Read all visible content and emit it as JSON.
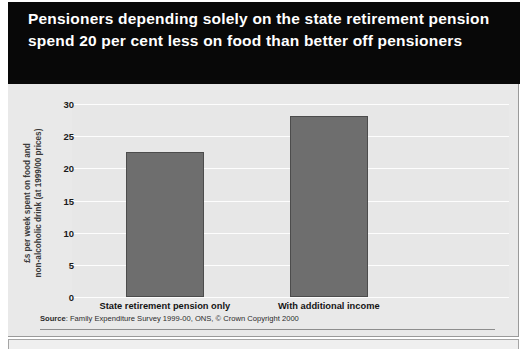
{
  "figure": {
    "title": "Pensioners depending solely on the state retirement pension spend 20 per cent less on food than better off pensioners",
    "source_prefix": "Source",
    "source_text": ": Family Expenditure Survey 1999-00, ONS, © Crown Copyright 2000"
  },
  "colors": {
    "header_background": "#080808",
    "title_text": "#ffffff",
    "panel_background": "#e9e9e9",
    "plot_background": "#e7e7e7",
    "gridline": "#fdfdfd",
    "bar_fill": "#6e6e6e",
    "bar_border": "#4c4c4c",
    "axis_text": "#1a1a1a"
  },
  "chart_data": {
    "type": "bar",
    "title": "Pensioners depending solely on the state retirement pension spend 20 per cent less on food than better off pensioners",
    "categories": [
      "State retirement pension only",
      "With additional income"
    ],
    "values": [
      22.5,
      28.1
    ],
    "xlabel": "",
    "ylabel": "£s per week spent on food and non-alcoholic drink (at 1999/00 prices)",
    "ylabel_line1": "£s per week spent on food and",
    "ylabel_line2": "non-alcoholic drink (at 1999/00 prices)",
    "ylim": [
      0,
      30
    ],
    "ytick_step": 5,
    "yticks": [
      0,
      5,
      10,
      15,
      20,
      25,
      30
    ],
    "ytick_labels": [
      "0",
      "5",
      "10",
      "15",
      "20",
      "25",
      "30"
    ],
    "grid": true,
    "legend": false,
    "legend_position": "none",
    "source": "Source: Family Expenditure Survey 1999-00, ONS, © Crown Copyright 2000"
  }
}
